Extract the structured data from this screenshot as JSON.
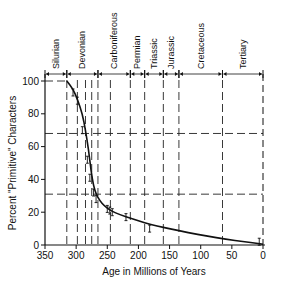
{
  "chart_data": {
    "type": "line",
    "title": "",
    "xlabel": "Age in Millions of Years",
    "ylabel": "Percent \"Primitive\" Characters",
    "xlim": [
      350,
      0
    ],
    "ylim": [
      0,
      100
    ],
    "x_ticks": [
      350,
      300,
      250,
      200,
      150,
      100,
      50,
      0
    ],
    "y_ticks": [
      0,
      20,
      40,
      60,
      80,
      100
    ],
    "grid": false,
    "periods": [
      {
        "name": "Silurian",
        "start": 350,
        "end": 315
      },
      {
        "name": "Devonian",
        "start": 315,
        "end": 265
      },
      {
        "name": "Carboniferous",
        "start": 265,
        "end": 213
      },
      {
        "name": "Permian",
        "start": 213,
        "end": 190
      },
      {
        "name": "Triassic",
        "start": 190,
        "end": 160
      },
      {
        "name": "Jurassic",
        "start": 160,
        "end": 135
      },
      {
        "name": "Cretaceous",
        "start": 135,
        "end": 65
      },
      {
        "name": "Tertiary",
        "start": 65,
        "end": 0
      }
    ],
    "horizontal_reference_lines": [
      68,
      31
    ],
    "vertical_reference_lines": [
      315,
      298,
      285,
      275,
      265,
      245,
      213,
      190,
      160,
      135,
      65,
      0
    ],
    "series": [
      {
        "name": "Percent primitive characters (fitted curve)",
        "x": [
          315,
          305,
          298,
          290,
          285,
          280,
          276,
          272,
          268,
          262,
          255,
          245,
          230,
          210,
          190,
          170,
          150,
          120,
          90,
          60,
          30,
          10,
          0
        ],
        "y": [
          100,
          95,
          89,
          80,
          70,
          58,
          45,
          36,
          31,
          27,
          24,
          21,
          18.5,
          16,
          13.5,
          11.5,
          10,
          7.5,
          5.5,
          3.5,
          2,
          1,
          0.5
        ]
      },
      {
        "name": "Observed points (with error bars)",
        "x": [
          305,
          298,
          290,
          282,
          278,
          272,
          268,
          250,
          246,
          242,
          220,
          182,
          6
        ],
        "y": [
          93,
          88,
          70,
          52,
          41,
          32,
          28,
          22,
          21,
          20,
          17,
          10,
          2
        ]
      }
    ]
  }
}
